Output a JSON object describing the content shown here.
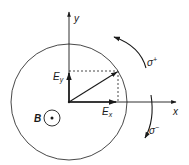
{
  "diagram": {
    "colors": {
      "stroke": "#1a1a1a",
      "background": "#ffffff"
    },
    "axes": {
      "x_label": "x",
      "y_label": "y"
    },
    "components": {
      "ex_label_main": "E",
      "ex_label_sub": "x",
      "ey_label_main": "E",
      "ey_label_sub": "y"
    },
    "magnetic_field": {
      "label": "B",
      "direction": "out-of-page"
    },
    "polarizations": {
      "sigma_plus_main": "σ",
      "sigma_plus_sup": "+",
      "sigma_minus_main": "σ",
      "sigma_minus_sup": "−"
    }
  }
}
